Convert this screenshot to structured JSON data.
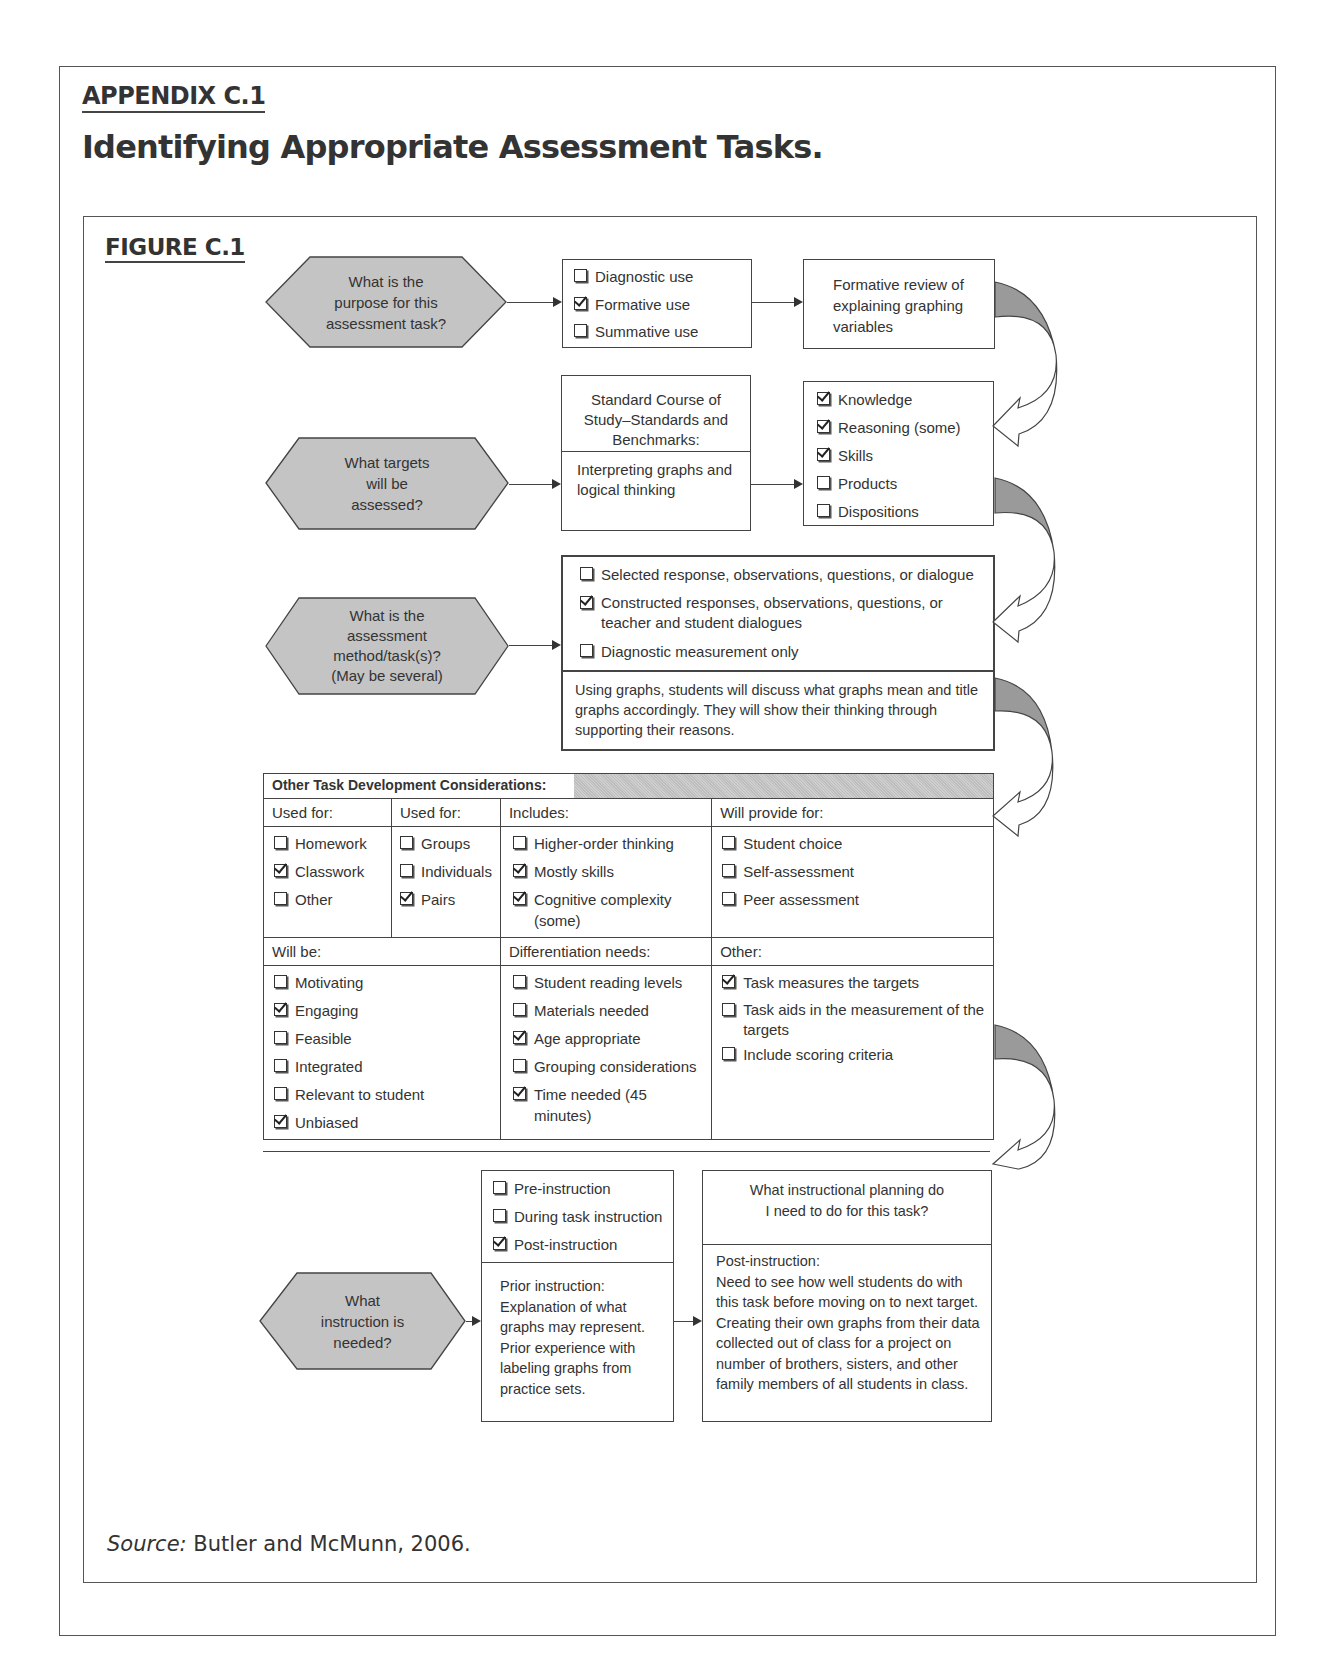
{
  "header": {
    "appendix_label": "APPENDIX C.1",
    "title": "Identifying Appropriate Assessment Tasks.",
    "figure_label": "FIGURE C.1"
  },
  "colors": {
    "hexagon_fill": "#c4c4c4",
    "border": "#444444",
    "text": "#333333",
    "curved_arrow_fill": "#9a9a9a"
  },
  "flow": {
    "row1": {
      "question": "What is the\npurpose for this\nassessment task?",
      "options": [
        {
          "label": "Diagnostic use",
          "checked": false
        },
        {
          "label": "Formative use",
          "checked": true
        },
        {
          "label": "Summative use",
          "checked": false
        }
      ],
      "result": "Formative review of explaining graphing variables"
    },
    "row2": {
      "question": "What targets\nwill be\nassessed?",
      "standards_title": "Standard Course of Study–Standards and Benchmarks:",
      "standards_content": "Interpreting graphs and logical thinking",
      "targets": [
        {
          "label": "Knowledge",
          "checked": true
        },
        {
          "label": "Reasoning (some)",
          "checked": true
        },
        {
          "label": "Skills",
          "checked": true
        },
        {
          "label": "Products",
          "checked": false
        },
        {
          "label": "Dispositions",
          "checked": false
        }
      ]
    },
    "row3": {
      "question": "What is the\nassessment\nmethod/task(s)?\n(May be several)",
      "methods": [
        {
          "label": "Selected response, observations, questions, or dialogue",
          "checked": false
        },
        {
          "label": "Constructed responses, observations, questions, or teacher and student dialogues",
          "checked": true
        },
        {
          "label": "Diagnostic measurement only",
          "checked": false
        }
      ],
      "description": "Using graphs, students will discuss what graphs mean and title graphs accordingly. They will show their thinking through supporting their reasons."
    },
    "considerations": {
      "title": "Other Task Development Considerations:",
      "top_columns": [
        {
          "header": "Used for:",
          "items": [
            {
              "label": "Homework",
              "checked": false
            },
            {
              "label": "Classwork",
              "checked": true
            },
            {
              "label": "Other",
              "checked": false
            }
          ]
        },
        {
          "header": "Used for:",
          "items": [
            {
              "label": "Groups",
              "checked": false
            },
            {
              "label": "Individuals",
              "checked": false
            },
            {
              "label": "Pairs",
              "checked": true
            }
          ]
        },
        {
          "header": "Includes:",
          "items": [
            {
              "label": "Higher-order thinking",
              "checked": false
            },
            {
              "label": "Mostly skills",
              "checked": true
            },
            {
              "label": "Cognitive complexity (some)",
              "checked": true
            }
          ]
        },
        {
          "header": "Will provide for:",
          "items": [
            {
              "label": "Student choice",
              "checked": false
            },
            {
              "label": "Self-assessment",
              "checked": false
            },
            {
              "label": "Peer assessment",
              "checked": false
            }
          ]
        }
      ],
      "bottom_columns": [
        {
          "header": "Will be:",
          "items": [
            {
              "label": "Motivating",
              "checked": false
            },
            {
              "label": "Engaging",
              "checked": true
            },
            {
              "label": "Feasible",
              "checked": false
            },
            {
              "label": "Integrated",
              "checked": false
            },
            {
              "label": "Relevant to student",
              "checked": false
            },
            {
              "label": "Unbiased",
              "checked": true
            }
          ]
        },
        {
          "header": "Differentiation needs:",
          "items": [
            {
              "label": "Student reading levels",
              "checked": false
            },
            {
              "label": "Materials needed",
              "checked": false
            },
            {
              "label": "Age appropriate",
              "checked": true
            },
            {
              "label": "Grouping considerations",
              "checked": false
            },
            {
              "label": "Time needed (45 minutes)",
              "checked": true
            }
          ]
        },
        {
          "header": "Other:",
          "items": [
            {
              "label": "Task measures the targets",
              "checked": true
            },
            {
              "label": "Task aids in the measurement of the targets",
              "checked": false
            },
            {
              "label": "Include scoring criteria",
              "checked": false
            }
          ]
        }
      ]
    },
    "row4": {
      "question": "What\ninstruction is\nneeded?",
      "timing": [
        {
          "label": "Pre-instruction",
          "checked": false
        },
        {
          "label": "During task instruction",
          "checked": false
        },
        {
          "label": "Post-instruction",
          "checked": true
        }
      ],
      "prior_instruction": "Prior instruction: Explanation of what graphs may represent. Prior experience with labeling graphs from practice sets.",
      "planning_question": "What instructional planning do I need to do for this task?",
      "planning_answer_label": "Post-instruction:",
      "planning_answer": "Need to see how well students do with this task before moving on to next target. Creating their own graphs from their data collected out of class for a project on number of brothers, sisters, and other family members of all students in class."
    }
  },
  "footer": {
    "source_label": "Source:",
    "source_text": "Butler and McMunn, 2006."
  }
}
